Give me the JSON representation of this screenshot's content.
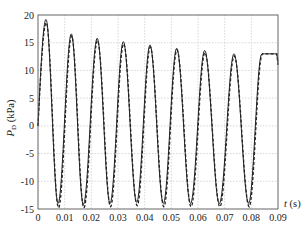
{
  "chart_data": {
    "type": "line",
    "title": "",
    "xlabel": "t (s)",
    "ylabel": "P_D (kPa)",
    "ylabel_main": "P",
    "ylabel_sub": "D",
    "ylabel_unit": "(kPa)",
    "xlabel_var": "t",
    "xlabel_unit": "(s)",
    "xlim": [
      0,
      0.09
    ],
    "ylim": [
      -15,
      20
    ],
    "xticks": [
      0,
      0.01,
      0.02,
      0.03,
      0.04,
      0.05,
      0.06,
      0.07,
      0.08,
      0.09
    ],
    "xtick_labels": [
      "0",
      "0.01",
      "0.02",
      "0.03",
      "0.04",
      "0.05",
      "0.06",
      "0.07",
      "0.08",
      "0.09"
    ],
    "yticks": [
      -15,
      -10,
      -5,
      0,
      5,
      10,
      15,
      20
    ],
    "ytick_labels": [
      "-15",
      "-10",
      "-5",
      "0",
      "5",
      "10",
      "15",
      "20"
    ],
    "grid": true,
    "legend": "none",
    "series": [
      {
        "name": "solid",
        "style": "solid",
        "color": "#222222",
        "peaks": [
          {
            "t": 0.003,
            "v": 19.2
          },
          {
            "t": 0.0125,
            "v": 16.6
          },
          {
            "t": 0.0222,
            "v": 15.8
          },
          {
            "t": 0.032,
            "v": 15.2
          },
          {
            "t": 0.042,
            "v": 14.6
          },
          {
            "t": 0.052,
            "v": 14.0
          },
          {
            "t": 0.0625,
            "v": 13.6
          },
          {
            "t": 0.0735,
            "v": 13.0
          }
        ],
        "troughs": [
          {
            "t": 0.0075,
            "v": -14.0
          },
          {
            "t": 0.017,
            "v": -14.2
          },
          {
            "t": 0.027,
            "v": -14.0
          },
          {
            "t": 0.037,
            "v": -13.8
          },
          {
            "t": 0.047,
            "v": -14.0
          },
          {
            "t": 0.0572,
            "v": -14.0
          },
          {
            "t": 0.068,
            "v": -14.0
          },
          {
            "t": 0.079,
            "v": -14.0
          }
        ],
        "end": {
          "t": 0.09,
          "v": 11.5
        }
      },
      {
        "name": "dashed",
        "style": "dashed",
        "color": "#222222",
        "peaks": [
          {
            "t": 0.0031,
            "v": 18.6
          },
          {
            "t": 0.0126,
            "v": 16.2
          },
          {
            "t": 0.0223,
            "v": 15.4
          },
          {
            "t": 0.0321,
            "v": 14.8
          },
          {
            "t": 0.0421,
            "v": 14.2
          },
          {
            "t": 0.0521,
            "v": 13.7
          },
          {
            "t": 0.0626,
            "v": 13.2
          },
          {
            "t": 0.0736,
            "v": 12.6
          }
        ],
        "troughs": [
          {
            "t": 0.0077,
            "v": -14.8
          },
          {
            "t": 0.0172,
            "v": -14.8
          },
          {
            "t": 0.0272,
            "v": -14.6
          },
          {
            "t": 0.0372,
            "v": -14.4
          },
          {
            "t": 0.0472,
            "v": -14.6
          },
          {
            "t": 0.0574,
            "v": -14.6
          },
          {
            "t": 0.0682,
            "v": -14.6
          },
          {
            "t": 0.0792,
            "v": -14.6
          }
        ],
        "end": {
          "t": 0.09,
          "v": 11.0
        }
      }
    ]
  }
}
